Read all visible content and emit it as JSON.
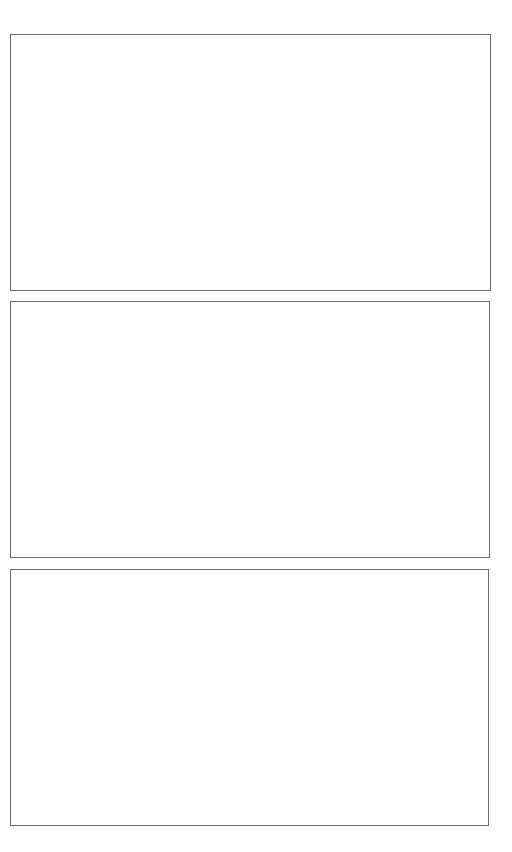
{
  "page": {
    "background_color": "#ffffff",
    "border_color": "#6e6e6e"
  },
  "frames": [
    {
      "label": ""
    },
    {
      "label": ""
    },
    {
      "label": ""
    }
  ]
}
